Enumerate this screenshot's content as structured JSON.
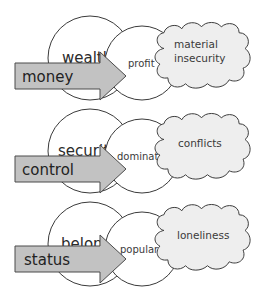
{
  "diagram": {
    "colors": {
      "arrow_fill": "#c2c2c2",
      "cloud_fill": "#eeeeee",
      "circle_fill": "#ffffff",
      "stroke": "#3a3a3a",
      "text": "#2a2a2a"
    },
    "rows": [
      {
        "arrow_label": "money",
        "big_circle_label": "wealth",
        "big_circle_label_visible": "wealt",
        "small_circle_label": "profit",
        "cloud_label_line1": "material",
        "cloud_label_line2": "insecurity"
      },
      {
        "arrow_label": "control",
        "big_circle_label": "security",
        "big_circle_label_visible": "securi",
        "small_circle_label": "domination",
        "small_circle_label_visible": "dominat",
        "cloud_label_line1": "conflicts",
        "cloud_label_line2": ""
      },
      {
        "arrow_label": "status",
        "big_circle_label": "belonging",
        "big_circle_label_visible": "belon",
        "small_circle_label": "popular",
        "cloud_label_line1": "loneliness",
        "cloud_label_line2": ""
      }
    ]
  }
}
